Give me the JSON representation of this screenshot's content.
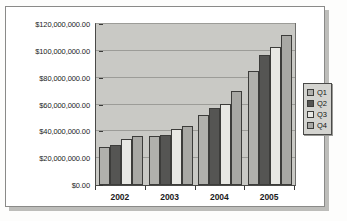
{
  "chart_data": {
    "type": "bar",
    "title": "",
    "subtitle": "",
    "xlabel": "",
    "ylabel": "",
    "categories": [
      "2002",
      "2003",
      "2004",
      "2005"
    ],
    "series": [
      {
        "name": "Q1",
        "color": "#b0b0ac",
        "values": [
          28000000,
          36500000,
          52000000,
          85000000
        ]
      },
      {
        "name": "Q2",
        "color": "#555553",
        "values": [
          30000000,
          37500000,
          57500000,
          97000000
        ]
      },
      {
        "name": "Q3",
        "color": "#e8e8e4",
        "values": [
          34500000,
          41500000,
          60500000,
          102500000
        ]
      },
      {
        "name": "Q4",
        "color": "#a8a8a4",
        "values": [
          36500000,
          44000000,
          70000000,
          111500000
        ]
      }
    ],
    "ylim": [
      0,
      120000000
    ],
    "ytick_values": [
      0,
      20000000,
      40000000,
      60000000,
      80000000,
      100000000,
      120000000
    ],
    "ytick_labels": [
      "$0.00",
      "$20,000,000.00",
      "$40,000,000.00",
      "$60,000,000.00",
      "$80,000,000.00",
      "$100,000,000.00",
      "$120,000,000.00"
    ],
    "grid": true,
    "legend_position": "right",
    "legend_entries": [
      "Q1",
      "Q2",
      "Q3",
      "Q4"
    ],
    "plot_background": "#c9c9c5",
    "gridline_color": "#9c9c98"
  },
  "page": {
    "ghost_text_a": "",
    "ghost_text_b": ""
  }
}
